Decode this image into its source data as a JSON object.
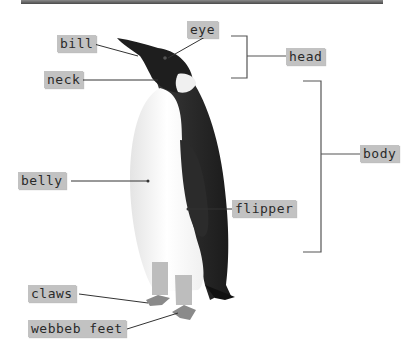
{
  "diagram": {
    "colors": {
      "label_bg": "#c2c2c2",
      "label_text": "#2a2a2a",
      "leader_line": "#333333",
      "bracket": "#555555",
      "top_bar": "#5a5a5a"
    },
    "labels": {
      "eye": "eye",
      "bill": "bill",
      "neck": "neck",
      "head": "head",
      "body": "body",
      "belly": "belly",
      "flipper": "flipper",
      "claws": "claws",
      "webbed_feet": "webbeb feet"
    },
    "groups": [
      {
        "name": "head",
        "members": [
          "bill",
          "eye",
          "neck"
        ]
      },
      {
        "name": "body",
        "members": [
          "belly",
          "flipper",
          "claws",
          "webbeb feet"
        ]
      }
    ]
  }
}
